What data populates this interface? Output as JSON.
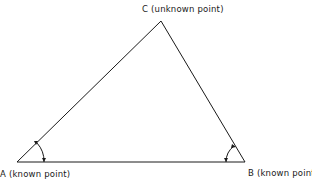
{
  "diagram": {
    "title": "",
    "points": {
      "A": {
        "label": "A (known point)",
        "x": 17,
        "y": 162
      },
      "B": {
        "label": "B (known point)",
        "x": 245,
        "y": 162
      },
      "C": {
        "label": "C (unknown point)",
        "x": 161,
        "y": 21
      }
    },
    "edges": [
      {
        "from": "A",
        "to": "B"
      },
      {
        "from": "A",
        "to": "C"
      },
      {
        "from": "B",
        "to": "C"
      }
    ],
    "angle_marks": [
      {
        "at": "A",
        "type": "measured-angle-arc"
      },
      {
        "at": "B",
        "type": "measured-angle-arc"
      }
    ],
    "colors": {
      "line": "#1a1a1a",
      "background": "#ffffff"
    }
  }
}
